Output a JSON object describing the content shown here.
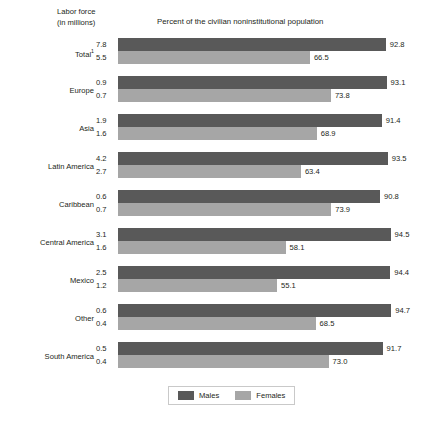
{
  "header": {
    "labor_force_line1": "Labor force",
    "labor_force_line2": "(in millions)",
    "percent_title": "Percent of the civilian noninstitutional population"
  },
  "legend": {
    "males_label": "Males",
    "females_label": "Females",
    "males_color": "#595959",
    "females_color": "#a6a6a6"
  },
  "chart_data": {
    "type": "bar",
    "title": "Percent of the civilian noninstitutional population",
    "xlabel": "Percent of the civilian noninstitutional population",
    "ylabel": "",
    "xlim": [
      0,
      100
    ],
    "grid": false,
    "orientation": "horizontal",
    "legend_position": "bottom",
    "secondary_axis_label": "Labor force (in millions)",
    "categories": [
      "Total¹",
      "Europe",
      "Asia",
      "Latin America",
      "Caribbean",
      "Central America",
      "Mexico",
      "Other",
      "South America"
    ],
    "series": [
      {
        "name": "Males",
        "values": [
          92.8,
          93.1,
          91.4,
          93.5,
          90.8,
          94.5,
          94.4,
          94.7,
          91.7
        ],
        "labor_force": [
          "7.8",
          "0.9",
          "1.9",
          "4.2",
          "0.6",
          "3.1",
          "2.5",
          "0.6",
          "0.5"
        ]
      },
      {
        "name": "Females",
        "values": [
          66.5,
          73.8,
          68.9,
          63.4,
          73.9,
          58.1,
          55.1,
          68.5,
          73.0
        ],
        "labor_force": [
          "5.5",
          "0.7",
          "1.6",
          "2.7",
          "0.7",
          "1.6",
          "1.2",
          "0.4",
          "0.4"
        ]
      }
    ],
    "rows": [
      {
        "category": "Total",
        "category_footnote": "1",
        "males_labor_force": "7.8",
        "females_labor_force": "5.5",
        "males_percent": "92.8",
        "females_percent": "66.5"
      },
      {
        "category": "Europe",
        "category_footnote": "",
        "males_labor_force": "0.9",
        "females_labor_force": "0.7",
        "males_percent": "93.1",
        "females_percent": "73.8"
      },
      {
        "category": "Asia",
        "category_footnote": "",
        "males_labor_force": "1.9",
        "females_labor_force": "1.6",
        "males_percent": "91.4",
        "females_percent": "68.9"
      },
      {
        "category": "Latin America",
        "category_footnote": "",
        "males_labor_force": "4.2",
        "females_labor_force": "2.7",
        "males_percent": "93.5",
        "females_percent": "63.4"
      },
      {
        "category": "Caribbean",
        "category_footnote": "",
        "males_labor_force": "0.6",
        "females_labor_force": "0.7",
        "males_percent": "90.8",
        "females_percent": "73.9"
      },
      {
        "category": "Central America",
        "category_footnote": "",
        "males_labor_force": "3.1",
        "females_labor_force": "1.6",
        "males_percent": "94.5",
        "females_percent": "58.1"
      },
      {
        "category": "Mexico",
        "category_footnote": "",
        "males_labor_force": "2.5",
        "females_labor_force": "1.2",
        "males_percent": "94.4",
        "females_percent": "55.1"
      },
      {
        "category": "Other",
        "category_footnote": "",
        "males_labor_force": "0.6",
        "females_labor_force": "0.4",
        "males_percent": "94.7",
        "females_percent": "68.5"
      },
      {
        "category": "South America",
        "category_footnote": "",
        "males_labor_force": "0.5",
        "females_labor_force": "0.4",
        "males_percent": "91.7",
        "females_percent": "73.0"
      }
    ]
  }
}
